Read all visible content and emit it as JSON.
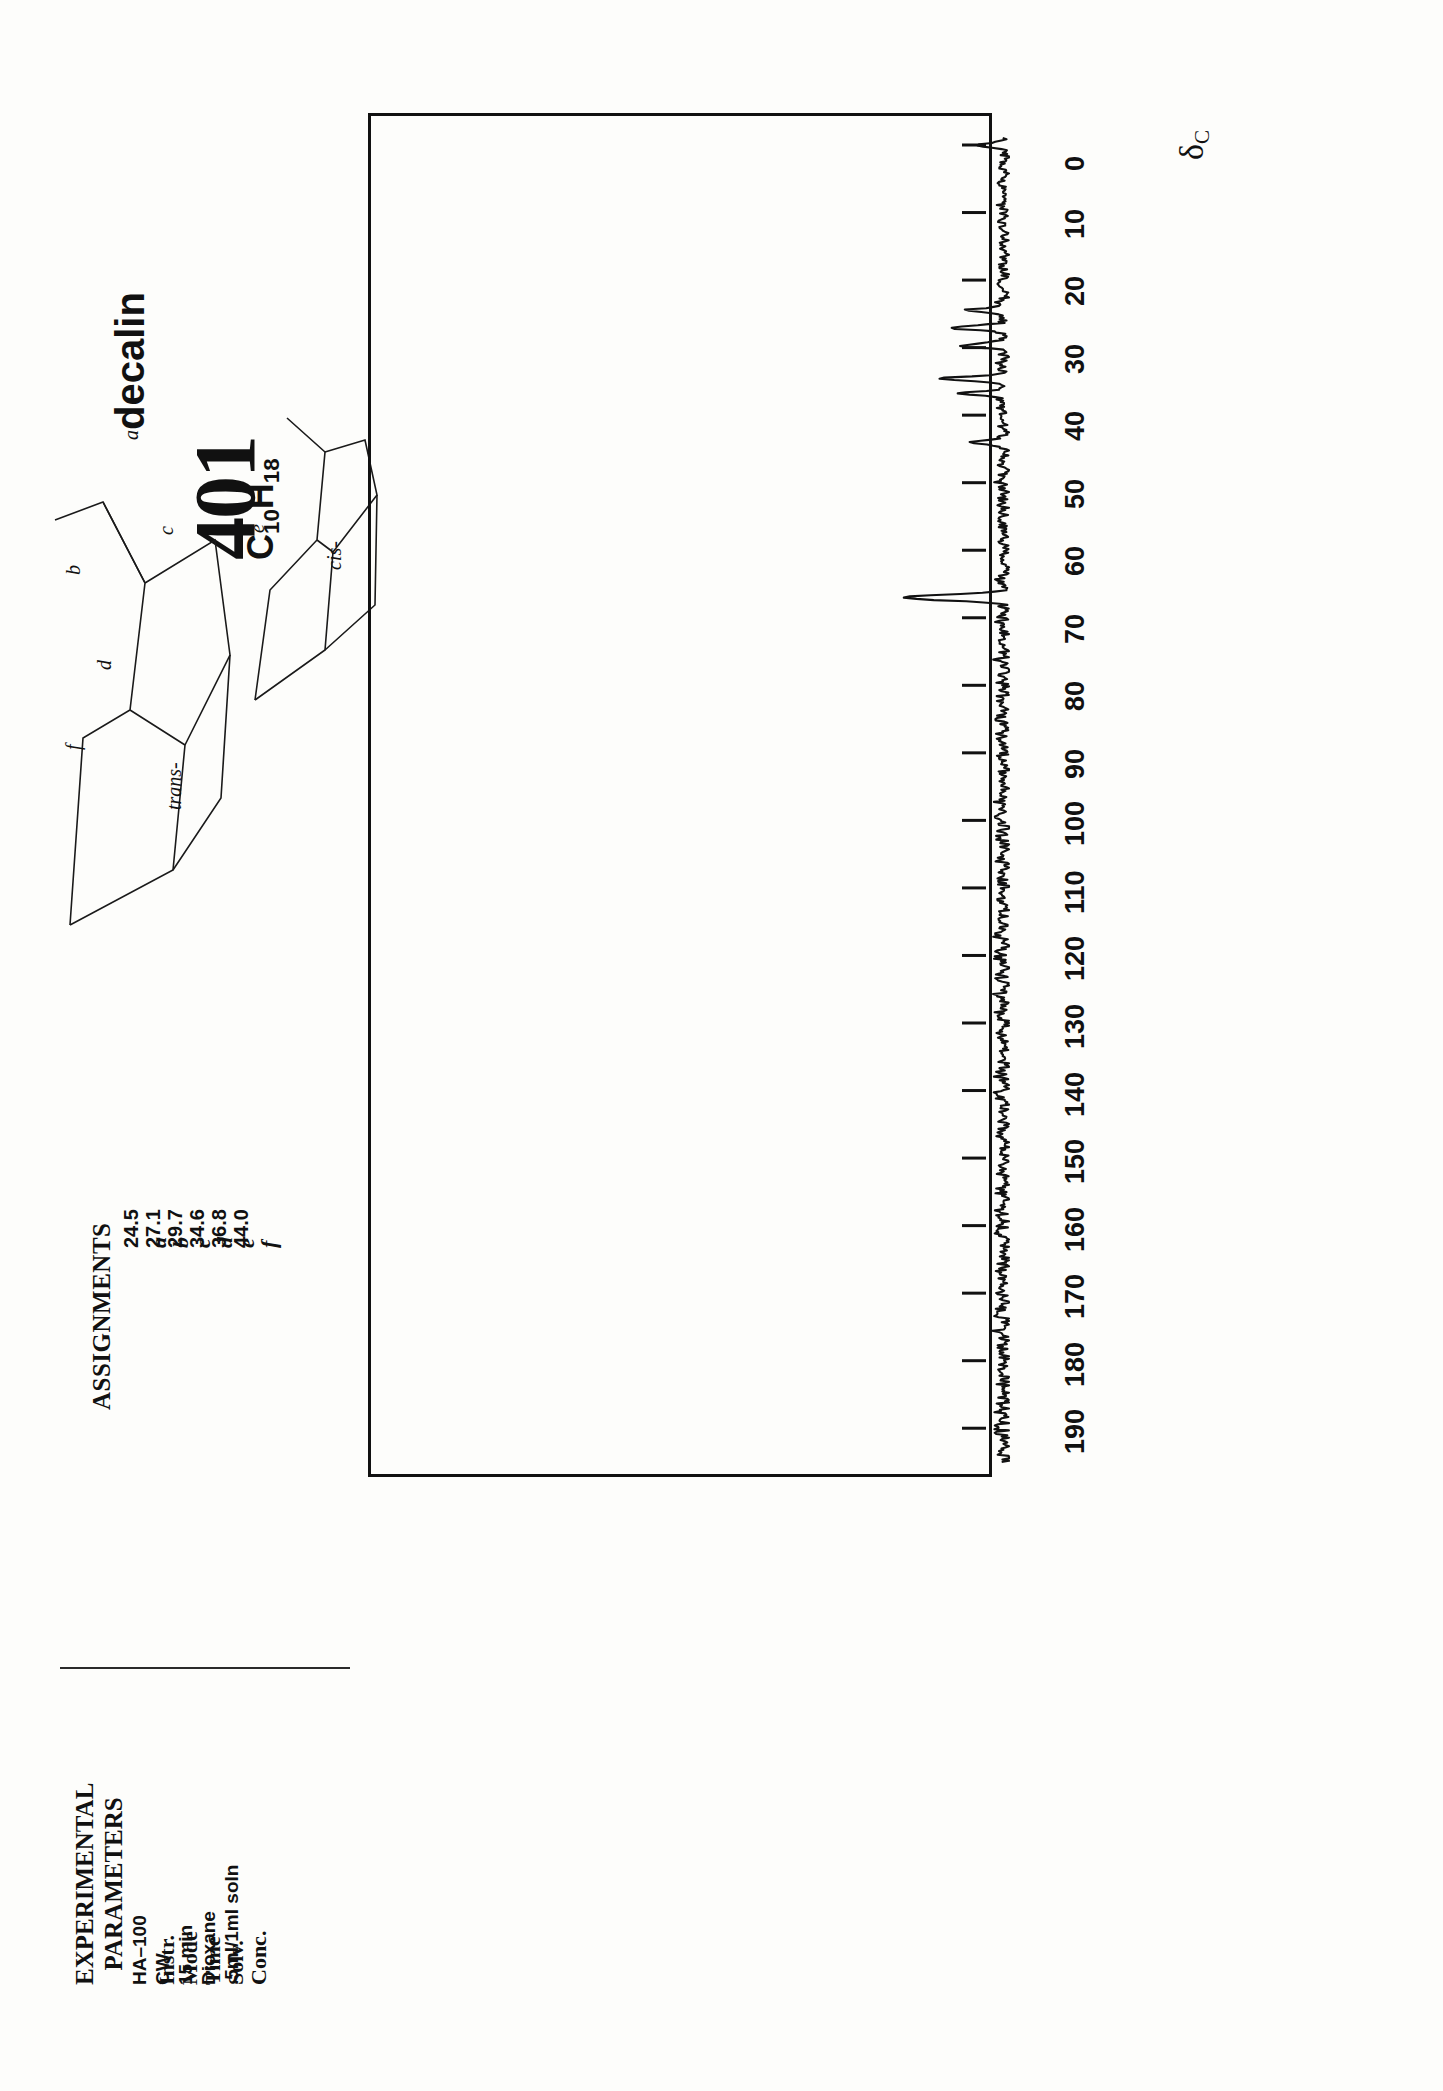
{
  "header": {
    "catalog_number": "401",
    "compound_name": "decalin",
    "formula_c": "C",
    "formula_c_sub": "10",
    "formula_h": "H",
    "formula_h_sub": "18"
  },
  "assignments": {
    "title": "ASSIGNMENTS",
    "rows": [
      {
        "letter": "a",
        "shift": "24.5"
      },
      {
        "letter": "b",
        "shift": "27.1"
      },
      {
        "letter": "c",
        "shift": "29.7"
      },
      {
        "letter": "d",
        "shift": "34.6"
      },
      {
        "letter": "e",
        "shift": "36.8"
      },
      {
        "letter": "f",
        "shift": "44.0"
      }
    ]
  },
  "experimental": {
    "title_line1": "EXPERIMENTAL",
    "title_line2": "PARAMETERS",
    "rows": [
      {
        "key": "Instr.",
        "value": "HA–100"
      },
      {
        "key": "Mode",
        "value": "CW"
      },
      {
        "key": "Time",
        "value": "15 min"
      },
      {
        "key": "Solv.",
        "value": "Dioxane"
      },
      {
        "key": "Conc.",
        "value": ".5ml/1ml soln"
      }
    ]
  },
  "structures": {
    "trans_label": "trans-",
    "cis_label": "cis-",
    "trans_atoms": [
      "b",
      "d",
      "f"
    ],
    "cis_atoms": [
      "a",
      "c",
      "e"
    ]
  },
  "axis": {
    "unit_label": "δ",
    "unit_sub": "C",
    "ticks": [
      "0",
      "10",
      "20",
      "30",
      "40",
      "50",
      "60",
      "70",
      "80",
      "90",
      "100",
      "110",
      "120",
      "130",
      "140",
      "150",
      "160",
      "170",
      "180",
      "190"
    ]
  },
  "chart_data": {
    "type": "line",
    "xlabel": "δC",
    "ylabel": "",
    "xlim": [
      0,
      195
    ],
    "grid": false,
    "legend": null,
    "orientation": "vertical-axis-rotated-90",
    "peaks": [
      {
        "shift": 24.5,
        "label": "a",
        "relative_height": 0.36
      },
      {
        "shift": 27.1,
        "label": "b",
        "relative_height": 0.52
      },
      {
        "shift": 29.7,
        "label": "c",
        "relative_height": 0.4
      },
      {
        "shift": 34.6,
        "label": "d",
        "relative_height": 0.62
      },
      {
        "shift": 36.8,
        "label": "e",
        "relative_height": 0.44
      },
      {
        "shift": 44.0,
        "label": "f",
        "relative_height": 0.3
      },
      {
        "shift": 67.0,
        "label": "dioxane solvent",
        "relative_height": 1.0
      }
    ],
    "tms_reference": {
      "shift": 0.0,
      "relative_height": 0.22
    },
    "baseline_noise": true,
    "noise_range": [
      0,
      195
    ]
  }
}
